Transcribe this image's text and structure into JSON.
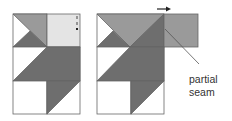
{
  "diagram": {
    "colors": {
      "dark": "#6e6e6e",
      "medium": "#9a9a9a",
      "light": "#e4e4e4",
      "white": "#ffffff",
      "stroke": "#666666"
    },
    "left_block": {
      "name": "quilt block before partial seam"
    },
    "right_block": {
      "name": "quilt block with partial seam"
    },
    "annotation": {
      "line1": "partial",
      "line2": "seam"
    },
    "arrow": "right-arrow"
  }
}
